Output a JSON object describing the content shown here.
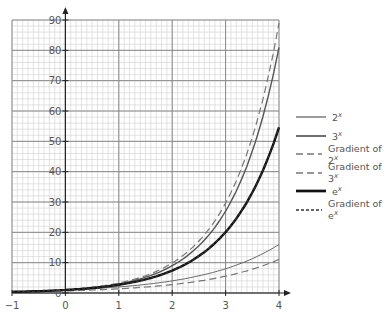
{
  "chart_data": {
    "type": "line",
    "title": "",
    "xlabel": "",
    "ylabel": "",
    "xlim": [
      -1,
      4
    ],
    "ylim": [
      0,
      90
    ],
    "x_ticks": [
      "-1",
      "0",
      "1",
      "2",
      "3",
      "4"
    ],
    "y_ticks": [
      "0",
      "10",
      "20",
      "30",
      "40",
      "50",
      "60",
      "70",
      "80",
      "90"
    ],
    "grid": true,
    "legend_position": "right",
    "series": [
      {
        "name": "2^x",
        "label": "2",
        "sup": "x",
        "style": "thin-solid",
        "x": [
          -1,
          0,
          1,
          2,
          3,
          4
        ],
        "values": [
          0.5,
          1,
          2,
          4,
          8,
          16
        ]
      },
      {
        "name": "3^x",
        "label": "3",
        "sup": "x",
        "style": "medium-solid",
        "x": [
          -1,
          0,
          1,
          2,
          3,
          4
        ],
        "values": [
          0.33,
          1,
          3,
          9,
          27,
          81
        ]
      },
      {
        "name": "Gradient of 2^x",
        "label": "Gradient of 2",
        "sup": "x",
        "style": "long-dash",
        "x": [
          -1,
          0,
          1,
          2,
          3,
          4
        ],
        "values": [
          0.35,
          0.69,
          1.39,
          2.77,
          5.55,
          11.09
        ]
      },
      {
        "name": "Gradient of 3^x",
        "label": "Gradient of 3",
        "sup": "x",
        "style": "long-dash",
        "x": [
          -1,
          0,
          1,
          2,
          3,
          4
        ],
        "values": [
          0.37,
          1.1,
          3.3,
          9.89,
          29.66,
          88.99
        ]
      },
      {
        "name": "e^x",
        "label": "e",
        "sup": "x",
        "style": "thick-solid",
        "x": [
          -1,
          0,
          1,
          2,
          3,
          4
        ],
        "values": [
          0.37,
          1,
          2.72,
          7.39,
          20.09,
          54.6
        ]
      },
      {
        "name": "Gradient of e^x",
        "label": "Gradient of e",
        "sup": "x",
        "style": "short-dash",
        "x": [
          -1,
          0,
          1,
          2,
          3,
          4
        ],
        "values": [
          0.37,
          1,
          2.72,
          7.39,
          20.09,
          54.6
        ]
      }
    ]
  },
  "colors": {
    "grid_major": "#888888",
    "grid_minor": "#d0d0d0",
    "axis": "#222222",
    "text": "#555555"
  }
}
